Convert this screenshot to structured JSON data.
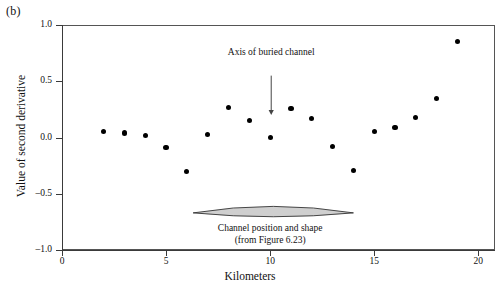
{
  "panel": {
    "letter": "(b)"
  },
  "chart_data": {
    "type": "scatter",
    "title": "",
    "xlabel": "Kilometers",
    "ylabel": "Value of second derivative",
    "xlim": [
      0,
      20.8
    ],
    "ylim": [
      -1.0,
      1.0
    ],
    "grid": false,
    "legend": "none",
    "xticks": [
      0,
      5,
      10,
      15,
      20
    ],
    "xtick_labels": [
      "0",
      "5",
      "10",
      "15",
      "20"
    ],
    "yticks": [
      -1.0,
      -0.5,
      0.0,
      0.5,
      1.0
    ],
    "ytick_labels": [
      "-1.0",
      "-0.5",
      "0.0",
      "0.5",
      "1.0"
    ],
    "marker": {
      "shape": "circle",
      "color": "#000000",
      "size": 5
    },
    "series": [
      {
        "name": "Second derivative of gravity profile",
        "x": [
          2,
          3,
          4,
          5,
          6,
          7,
          8,
          9,
          10,
          11,
          12,
          13,
          14,
          15,
          16,
          17,
          18,
          19
        ],
        "y": [
          0.05,
          0.04,
          0.02,
          -0.09,
          -0.3,
          0.03,
          0.27,
          0.15,
          0.0,
          0.26,
          0.17,
          -0.08,
          -0.29,
          0.05,
          0.09,
          0.18,
          0.35,
          0.85
        ]
      }
    ],
    "annotations": [
      {
        "name": "axis-of-buried-channel",
        "text": "Axis of buried channel",
        "x": 10.05,
        "y": 0.75,
        "arrow": {
          "from_y": 0.55,
          "to_y": 0.2,
          "x": 10.05
        }
      },
      {
        "name": "channel-position-and-shape",
        "line1": "Channel position and shape",
        "line2": "(from Figure 6.23)",
        "x": 10.0,
        "y": -0.8
      }
    ],
    "shapes": [
      {
        "name": "buried-channel-lens",
        "type": "lens",
        "x_start": 6.3,
        "x_end": 14.0,
        "y_center": -0.67,
        "max_thickness": 0.055,
        "fill": "#cfcfcf",
        "stroke": "#333333"
      }
    ]
  },
  "colors": {
    "axis": "#3a3a3a",
    "frame": "#555555",
    "marker": "#000000",
    "channel_fill": "#cfcfcf",
    "channel_stroke": "#333333",
    "text": "#111111",
    "background": "#ffffff"
  }
}
